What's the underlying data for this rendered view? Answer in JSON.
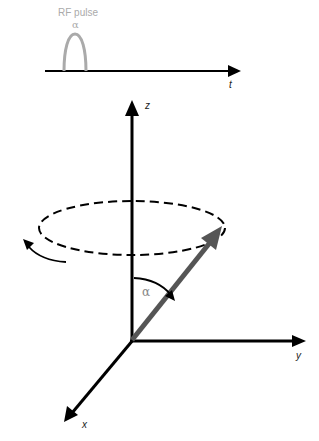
{
  "pulse_sequence": {
    "label": "RF pulse",
    "flip_angle_symbol": "α",
    "time_axis_label": "t"
  },
  "coordinate_frame": {
    "axes": {
      "z": "z",
      "y": "y",
      "x": "x"
    },
    "flip_angle_symbol": "α"
  },
  "colors": {
    "axes": "#000000",
    "rf_pulse": "#aaaaaa",
    "magnetization_vector": "#555555",
    "precession_path": "#000000",
    "label_gray": "#888888"
  }
}
